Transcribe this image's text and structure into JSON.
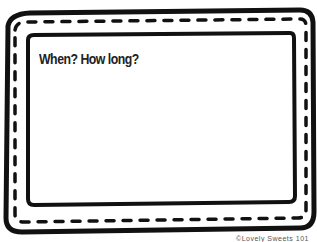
{
  "card": {
    "prompt": "When? How long?",
    "credit": "©Lovely Sweets 101",
    "border_color": "#111111",
    "background": "#ffffff"
  }
}
